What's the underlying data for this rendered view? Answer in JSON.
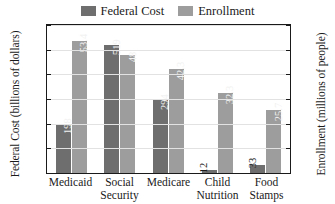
{
  "chart_data": {
    "type": "bar",
    "title": "",
    "categories": [
      "Medicaid",
      "Social Security",
      "Medicare",
      "Child Nutrition",
      "Food Stamps"
    ],
    "category_lines": [
      [
        "Medicaid"
      ],
      [
        "Social",
        "Security"
      ],
      [
        "Medicare"
      ],
      [
        "Child",
        "Nutrition"
      ],
      [
        "Food",
        "Stamps"
      ]
    ],
    "series": [
      {
        "name": "Federal Cost",
        "axis": "left",
        "color": "#6e6e6e",
        "values": [
          198,
          519,
          294,
          12,
          33
        ],
        "labels": [
          "198",
          "519",
          "294",
          "12",
          "33"
        ]
      },
      {
        "name": "Enrollment",
        "axis": "right",
        "color": "#9d9d9d",
        "values": [
          53.4,
          48,
          42.3,
          32.3,
          25.7
        ],
        "labels": [
          "53.4",
          "48",
          "42.3",
          "32.3",
          "25.7"
        ]
      }
    ],
    "xlabel": "",
    "ylabel": "Federal Cost (billions of dollars)",
    "y2label": "Enrollment (millions of people)",
    "ylim": [
      0,
      600
    ],
    "y2lim": [
      0,
      60
    ],
    "yticks": [
      "0",
      "100",
      "200",
      "300",
      "400",
      "500",
      "600"
    ],
    "y2ticks": [
      "0",
      "10",
      "20",
      "30",
      "40",
      "50",
      "60"
    ],
    "grid": true,
    "legend_position": "top-center",
    "legend": [
      {
        "label": "Federal Cost",
        "color": "#6e6e6e"
      },
      {
        "label": "Enrollment",
        "color": "#9d9d9d"
      }
    ]
  }
}
